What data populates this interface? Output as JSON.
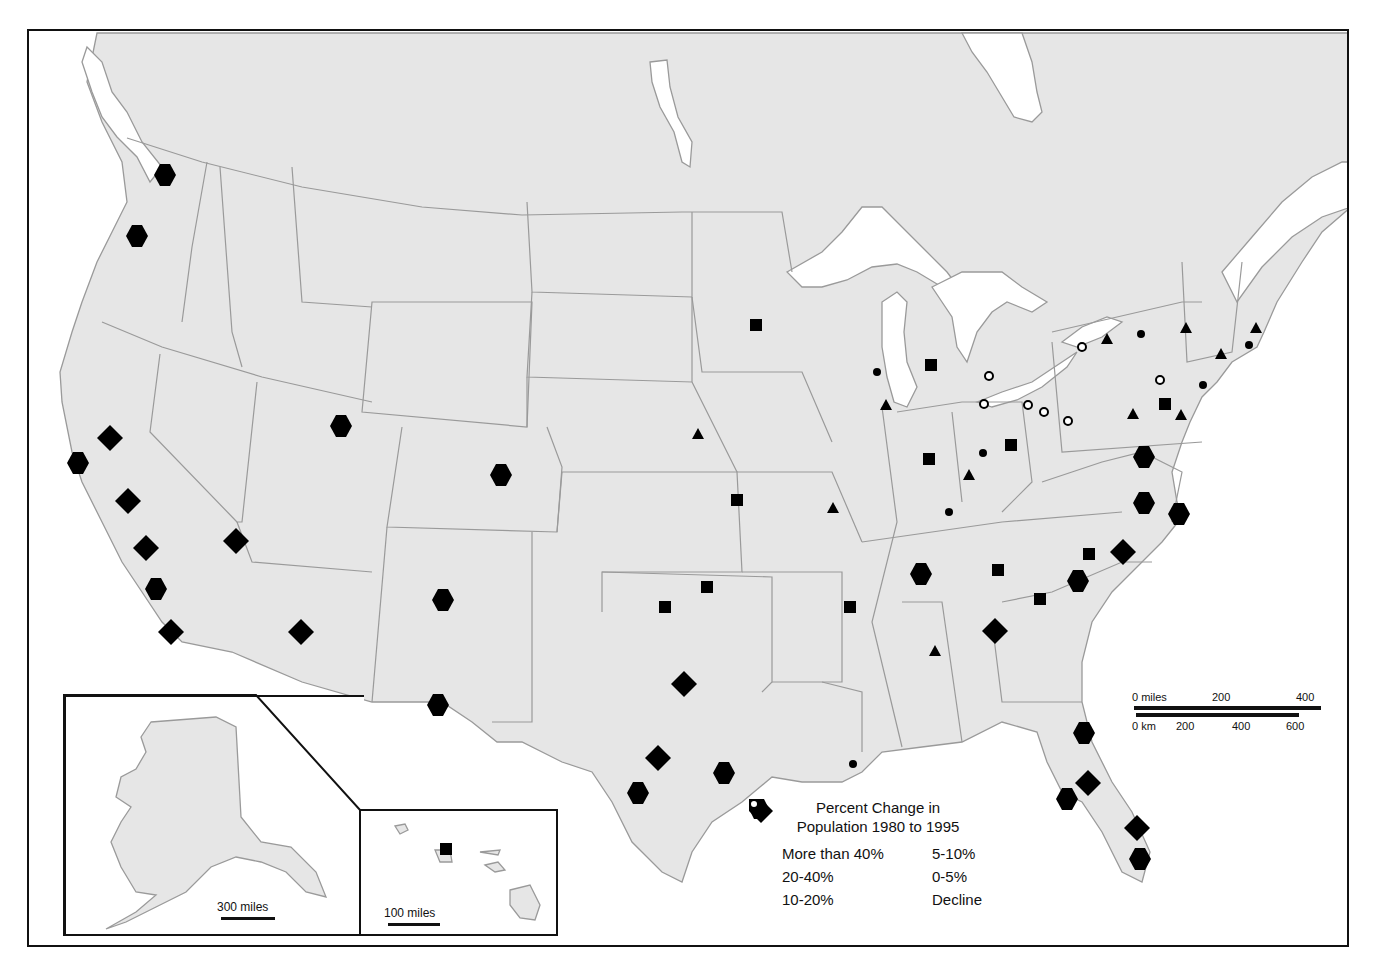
{
  "legend": {
    "title_line1": "Percent Change in",
    "title_line2": "Population 1980 to 1995",
    "items": [
      {
        "symbol": "diamond",
        "label": "More than 40%"
      },
      {
        "symbol": "triangle",
        "label": "5-10%"
      },
      {
        "symbol": "hexagon",
        "label": "20-40%"
      },
      {
        "symbol": "dot",
        "label": "0-5%"
      },
      {
        "symbol": "square",
        "label": "10-20%"
      },
      {
        "symbol": "ring",
        "label": "Decline"
      }
    ]
  },
  "scale": {
    "miles_0": "0 miles",
    "miles_200": "200",
    "miles_400": "400",
    "km_0": "0 km",
    "km_200": "200",
    "km_400": "400",
    "km_600": "600"
  },
  "insets": {
    "alaska_scale": "300 miles",
    "hawaii_scale": "100 miles"
  },
  "markers": [
    {
      "x": 165,
      "y": 175,
      "s": "hexagon"
    },
    {
      "x": 137,
      "y": 236,
      "s": "hexagon"
    },
    {
      "x": 110,
      "y": 438,
      "s": "diamond"
    },
    {
      "x": 78,
      "y": 463,
      "s": "hexagon"
    },
    {
      "x": 128,
      "y": 501,
      "s": "diamond"
    },
    {
      "x": 146,
      "y": 548,
      "s": "diamond"
    },
    {
      "x": 156,
      "y": 589,
      "s": "hexagon"
    },
    {
      "x": 171,
      "y": 632,
      "s": "diamond"
    },
    {
      "x": 236,
      "y": 541,
      "s": "diamond"
    },
    {
      "x": 301,
      "y": 632,
      "s": "diamond"
    },
    {
      "x": 341,
      "y": 426,
      "s": "hexagon"
    },
    {
      "x": 501,
      "y": 475,
      "s": "hexagon"
    },
    {
      "x": 443,
      "y": 600,
      "s": "hexagon"
    },
    {
      "x": 438,
      "y": 705,
      "s": "hexagon"
    },
    {
      "x": 684,
      "y": 684,
      "s": "diamond"
    },
    {
      "x": 658,
      "y": 758,
      "s": "diamond"
    },
    {
      "x": 638,
      "y": 793,
      "s": "hexagon"
    },
    {
      "x": 724,
      "y": 773,
      "s": "hexagon"
    },
    {
      "x": 665,
      "y": 607,
      "s": "square"
    },
    {
      "x": 707,
      "y": 587,
      "s": "square"
    },
    {
      "x": 737,
      "y": 500,
      "s": "square"
    },
    {
      "x": 756,
      "y": 325,
      "s": "square"
    },
    {
      "x": 698,
      "y": 434,
      "s": "triangle"
    },
    {
      "x": 833,
      "y": 508,
      "s": "triangle"
    },
    {
      "x": 850,
      "y": 607,
      "s": "square"
    },
    {
      "x": 853,
      "y": 764,
      "s": "dot"
    },
    {
      "x": 921,
      "y": 574,
      "s": "hexagon"
    },
    {
      "x": 935,
      "y": 651,
      "s": "triangle"
    },
    {
      "x": 995,
      "y": 631,
      "s": "diamond"
    },
    {
      "x": 998,
      "y": 570,
      "s": "square"
    },
    {
      "x": 1040,
      "y": 599,
      "s": "square"
    },
    {
      "x": 1078,
      "y": 581,
      "s": "hexagon"
    },
    {
      "x": 1089,
      "y": 554,
      "s": "square"
    },
    {
      "x": 1123,
      "y": 552,
      "s": "diamond"
    },
    {
      "x": 1144,
      "y": 457,
      "s": "hexagon"
    },
    {
      "x": 1144,
      "y": 503,
      "s": "hexagon"
    },
    {
      "x": 1179,
      "y": 514,
      "s": "hexagon"
    },
    {
      "x": 1084,
      "y": 733,
      "s": "hexagon"
    },
    {
      "x": 1088,
      "y": 783,
      "s": "diamond"
    },
    {
      "x": 1067,
      "y": 799,
      "s": "hexagon"
    },
    {
      "x": 1137,
      "y": 828,
      "s": "diamond"
    },
    {
      "x": 1140,
      "y": 859,
      "s": "hexagon"
    },
    {
      "x": 877,
      "y": 372,
      "s": "dot"
    },
    {
      "x": 886,
      "y": 405,
      "s": "triangle"
    },
    {
      "x": 931,
      "y": 365,
      "s": "square"
    },
    {
      "x": 929,
      "y": 459,
      "s": "square"
    },
    {
      "x": 1011,
      "y": 445,
      "s": "square"
    },
    {
      "x": 983,
      "y": 453,
      "s": "dot"
    },
    {
      "x": 969,
      "y": 475,
      "s": "triangle"
    },
    {
      "x": 949,
      "y": 512,
      "s": "dot"
    },
    {
      "x": 989,
      "y": 376,
      "s": "ring"
    },
    {
      "x": 984,
      "y": 404,
      "s": "ring"
    },
    {
      "x": 1028,
      "y": 405,
      "s": "ring"
    },
    {
      "x": 1044,
      "y": 412,
      "s": "ring"
    },
    {
      "x": 1068,
      "y": 421,
      "s": "ring"
    },
    {
      "x": 1082,
      "y": 347,
      "s": "ring"
    },
    {
      "x": 1160,
      "y": 380,
      "s": "ring"
    },
    {
      "x": 1107,
      "y": 339,
      "s": "triangle"
    },
    {
      "x": 1141,
      "y": 334,
      "s": "dot"
    },
    {
      "x": 1186,
      "y": 328,
      "s": "triangle"
    },
    {
      "x": 1221,
      "y": 354,
      "s": "triangle"
    },
    {
      "x": 1249,
      "y": 345,
      "s": "dot"
    },
    {
      "x": 1256,
      "y": 328,
      "s": "triangle"
    },
    {
      "x": 1203,
      "y": 385,
      "s": "dot"
    },
    {
      "x": 1165,
      "y": 404,
      "s": "square"
    },
    {
      "x": 1133,
      "y": 414,
      "s": "triangle"
    },
    {
      "x": 1181,
      "y": 415,
      "s": "triangle"
    },
    {
      "x": 446,
      "y": 849,
      "s": "square"
    }
  ]
}
